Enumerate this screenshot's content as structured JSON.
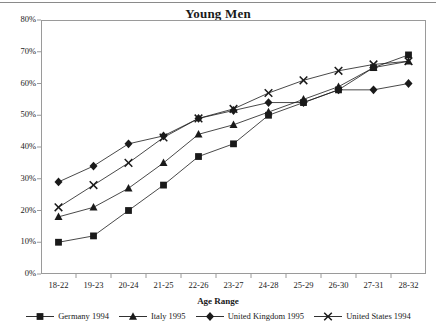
{
  "chart_data": {
    "type": "line",
    "title": "Young Men",
    "xlabel": "Age Range",
    "ylabel": "",
    "grid": false,
    "legend_position": "bottom",
    "ylim": [
      0,
      80
    ],
    "ytick_labels": [
      "0%",
      "10%",
      "20%",
      "30%",
      "40%",
      "50%",
      "60%",
      "70%",
      "80%"
    ],
    "ytick_values": [
      0,
      10,
      20,
      30,
      40,
      50,
      60,
      70,
      80
    ],
    "categories": [
      "18-22",
      "19-23",
      "20-24",
      "21-25",
      "22-26",
      "23-27",
      "24-28",
      "25-29",
      "26-30",
      "27-31",
      "28-32"
    ],
    "series": [
      {
        "name": "Germany 1994",
        "marker": "square",
        "color": "#1a1a1a",
        "values": [
          10,
          12,
          20,
          28,
          37,
          41,
          50,
          54,
          58,
          65,
          69
        ]
      },
      {
        "name": "Italy 1995",
        "marker": "triangle",
        "color": "#1a1a1a",
        "values": [
          18,
          21,
          27,
          35,
          44,
          47,
          51,
          55,
          59,
          65,
          67
        ]
      },
      {
        "name": "United Kingdom 1995",
        "marker": "diamond",
        "color": "#1a1a1a",
        "values": [
          29,
          34,
          41,
          43.5,
          49,
          51.5,
          54,
          54,
          58,
          58,
          60
        ]
      },
      {
        "name": "United States 1994",
        "marker": "cross",
        "color": "#1a1a1a",
        "values": [
          21,
          28,
          35,
          43,
          49,
          52,
          57,
          61,
          64,
          66,
          67
        ]
      }
    ]
  }
}
